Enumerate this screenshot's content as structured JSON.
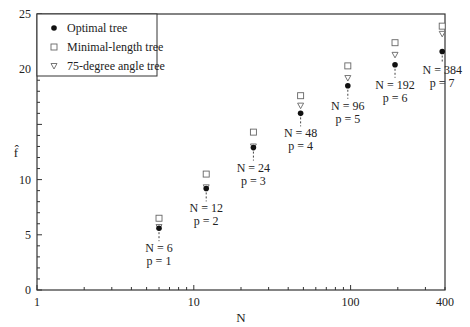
{
  "chart_data": {
    "type": "scatter",
    "title": "",
    "xlabel": "N",
    "ylabel": "f̂",
    "xscale": "log",
    "xlim": [
      1,
      400
    ],
    "ylim": [
      0,
      25
    ],
    "xticks": [
      1,
      10,
      100,
      400
    ],
    "yticks": [
      0,
      5,
      10,
      20,
      25
    ],
    "grid": false,
    "legend_position": "upper left",
    "x": [
      6,
      12,
      24,
      48,
      96,
      192,
      384
    ],
    "series": [
      {
        "name": "Optimal tree",
        "marker": "filled-circle",
        "values": [
          5.6,
          9.2,
          12.9,
          16.0,
          18.5,
          20.4,
          21.6
        ]
      },
      {
        "name": "Minimal-length tree",
        "marker": "open-square",
        "values": [
          6.5,
          10.5,
          14.3,
          17.6,
          20.3,
          22.4,
          23.9
        ]
      },
      {
        "name": "75-degree angle tree",
        "marker": "open-triangle-down",
        "values": [
          5.7,
          9.3,
          13.0,
          16.7,
          19.2,
          21.3,
          23.2
        ]
      }
    ],
    "annotations": [
      {
        "x": 6,
        "line1": "N = 6",
        "line2": "p = 1"
      },
      {
        "x": 12,
        "line1": "N = 12",
        "line2": "p = 2"
      },
      {
        "x": 24,
        "line1": "N = 24",
        "line2": "p = 3"
      },
      {
        "x": 48,
        "line1": "N = 48",
        "line2": "p = 4"
      },
      {
        "x": 96,
        "line1": "N = 96",
        "line2": "p = 5"
      },
      {
        "x": 192,
        "line1": "N = 192",
        "line2": "p = 6"
      },
      {
        "x": 384,
        "line1": "N = 384",
        "line2": "p = 7"
      }
    ]
  }
}
